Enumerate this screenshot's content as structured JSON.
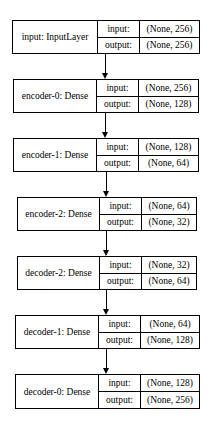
{
  "nodes": [
    {
      "name": "input: InputLayer",
      "input_label": "input:",
      "output_label": "output:",
      "input": "(None, 256)",
      "output": "(None, 256)"
    },
    {
      "name": "encoder-0: Dense",
      "input_label": "input:",
      "output_label": "output:",
      "input": "(None, 256)",
      "output": "(None, 128)"
    },
    {
      "name": "encoder-1: Dense",
      "input_label": "input:",
      "output_label": "output:",
      "input": "(None, 128)",
      "output": "(None, 64)"
    },
    {
      "name": "encoder-2: Dense",
      "input_label": "input:",
      "output_label": "output:",
      "input": "(None, 64)",
      "output": "(None, 32)"
    },
    {
      "name": "decoder-2: Dense",
      "input_label": "input:",
      "output_label": "output:",
      "input": "(None, 32)",
      "output": "(None, 64)"
    },
    {
      "name": "decoder-1: Dense",
      "input_label": "input:",
      "output_label": "output:",
      "input": "(None, 64)",
      "output": "(None, 128)"
    },
    {
      "name": "decoder-0: Dense",
      "input_label": "input:",
      "output_label": "output:",
      "input": "(None, 128)",
      "output": "(None, 256)"
    }
  ]
}
